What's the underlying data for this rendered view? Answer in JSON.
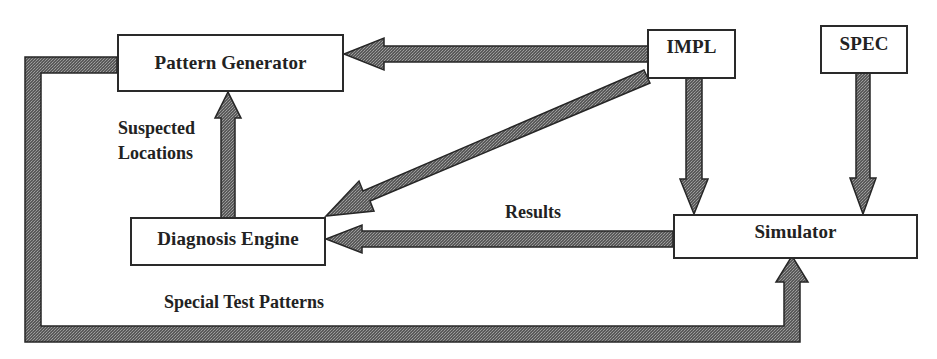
{
  "diagram": {
    "nodes": {
      "pattern_generator": {
        "label": "Pattern Generator"
      },
      "impl": {
        "label": "IMPL"
      },
      "spec": {
        "label": "SPEC"
      },
      "diagnosis_engine": {
        "label": "Diagnosis Engine"
      },
      "simulator": {
        "label": "Simulator"
      }
    },
    "edge_labels": {
      "suspected_line1": "Suspected",
      "suspected_line2": "Locations",
      "results": "Results",
      "special_test_patterns": "Special Test Patterns"
    },
    "edges": [
      {
        "from": "IMPL",
        "to": "Pattern Generator",
        "label": ""
      },
      {
        "from": "IMPL",
        "to": "Diagnosis Engine",
        "label": ""
      },
      {
        "from": "IMPL",
        "to": "Simulator",
        "label": ""
      },
      {
        "from": "SPEC",
        "to": "Simulator",
        "label": ""
      },
      {
        "from": "Simulator",
        "to": "Diagnosis Engine",
        "label": "Results"
      },
      {
        "from": "Diagnosis Engine",
        "to": "Pattern Generator",
        "label": "Suspected Locations"
      },
      {
        "from": "Pattern Generator",
        "to": "Simulator",
        "label": "Special Test Patterns"
      }
    ],
    "colors": {
      "arrow_fill": "#6e6e6e",
      "arrow_stroke": "#262626",
      "box_border": "#2a2a2a",
      "text": "#222222",
      "background": "#ffffff"
    }
  }
}
